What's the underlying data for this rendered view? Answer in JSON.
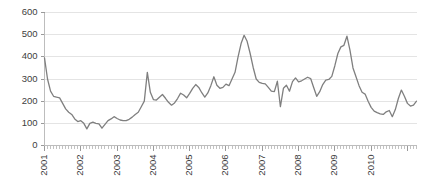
{
  "chart_data": {
    "type": "line",
    "title": "",
    "subtitle": "",
    "xlabel": "",
    "ylabel": "",
    "ylim": [
      0,
      600
    ],
    "ytick_labels": [
      "0",
      "100",
      "200",
      "300",
      "400",
      "500",
      "600"
    ],
    "yticks": [
      0,
      100,
      200,
      300,
      400,
      500,
      600
    ],
    "grid": true,
    "legend": false,
    "legend_position": "none",
    "x_tick_interval": "monthly",
    "xtick_labels": [
      "2001",
      "2002",
      "2003",
      "2004",
      "2005",
      "2006",
      "2007",
      "2008",
      "2009",
      "2010"
    ],
    "x_label_years": [
      2001,
      2002,
      2003,
      2004,
      2005,
      2006,
      2007,
      2008,
      2009,
      2010
    ],
    "x_label_rotation": -90,
    "x_start": "2001-01",
    "x_end": "2011-04",
    "series": [
      {
        "name": "series-1",
        "color": "#7f7f7f",
        "x": [
          "2001-01",
          "2001-02",
          "2001-03",
          "2001-04",
          "2001-05",
          "2001-06",
          "2001-07",
          "2001-08",
          "2001-09",
          "2001-10",
          "2001-11",
          "2001-12",
          "2002-01",
          "2002-02",
          "2002-03",
          "2002-04",
          "2002-05",
          "2002-06",
          "2002-07",
          "2002-08",
          "2002-09",
          "2002-10",
          "2002-11",
          "2002-12",
          "2003-01",
          "2003-02",
          "2003-03",
          "2003-04",
          "2003-05",
          "2003-06",
          "2003-07",
          "2003-08",
          "2003-09",
          "2003-10",
          "2003-11",
          "2003-12",
          "2004-01",
          "2004-02",
          "2004-03",
          "2004-04",
          "2004-05",
          "2004-06",
          "2004-07",
          "2004-08",
          "2004-09",
          "2004-10",
          "2004-11",
          "2004-12",
          "2005-01",
          "2005-02",
          "2005-03",
          "2005-04",
          "2005-05",
          "2005-06",
          "2005-07",
          "2005-08",
          "2005-09",
          "2005-10",
          "2005-11",
          "2005-12",
          "2006-01",
          "2006-02",
          "2006-03",
          "2006-04",
          "2006-05",
          "2006-06",
          "2006-07",
          "2006-08",
          "2006-09",
          "2006-10",
          "2006-11",
          "2006-12",
          "2007-01",
          "2007-02",
          "2007-03",
          "2007-04",
          "2007-05",
          "2007-06",
          "2007-07",
          "2007-08",
          "2007-09",
          "2007-10",
          "2007-11",
          "2007-12",
          "2008-01",
          "2008-02",
          "2008-03",
          "2008-04",
          "2008-05",
          "2008-06",
          "2008-07",
          "2008-08",
          "2008-09",
          "2008-10",
          "2008-11",
          "2008-12",
          "2009-01",
          "2009-02",
          "2009-03",
          "2009-04",
          "2009-05",
          "2009-06",
          "2009-07",
          "2009-08",
          "2009-09",
          "2009-10",
          "2009-11",
          "2009-12",
          "2010-01",
          "2010-02",
          "2010-03",
          "2010-04",
          "2010-05",
          "2010-06",
          "2010-07",
          "2010-08",
          "2010-09",
          "2010-10",
          "2010-11",
          "2010-12",
          "2011-01",
          "2011-02",
          "2011-03",
          "2011-04"
        ],
        "values": [
          395,
          300,
          245,
          222,
          218,
          215,
          190,
          165,
          150,
          140,
          120,
          108,
          112,
          100,
          75,
          100,
          105,
          100,
          98,
          78,
          95,
          112,
          120,
          130,
          122,
          115,
          112,
          112,
          118,
          128,
          140,
          150,
          175,
          200,
          330,
          240,
          207,
          205,
          218,
          230,
          213,
          195,
          182,
          192,
          212,
          236,
          228,
          215,
          235,
          258,
          275,
          262,
          238,
          218,
          237,
          270,
          310,
          272,
          258,
          262,
          277,
          270,
          300,
          330,
          400,
          460,
          497,
          470,
          415,
          352,
          300,
          285,
          280,
          278,
          262,
          245,
          243,
          290,
          175,
          258,
          272,
          245,
          288,
          305,
          287,
          292,
          300,
          308,
          302,
          262,
          222,
          243,
          275,
          295,
          298,
          312,
          360,
          415,
          445,
          452,
          493,
          430,
          350,
          310,
          270,
          240,
          232,
          200,
          172,
          155,
          148,
          143,
          140,
          152,
          158,
          130,
          162,
          212,
          250,
          222,
          190,
          178,
          182,
          200
        ],
        "key_points": [
          {
            "label": "start",
            "x": "2001-01",
            "y": 395
          },
          {
            "label": "trough",
            "x": "2002-03",
            "y": 75
          },
          {
            "label": "spike-2003",
            "x": "2003-11",
            "y": 330
          },
          {
            "label": "peak-2005",
            "x": "2006-07",
            "y": 497
          },
          {
            "label": "dip-2007",
            "x": "2007-07",
            "y": 175
          },
          {
            "label": "peak-2008",
            "x": "2009-05",
            "y": 493
          },
          {
            "label": "low-2009",
            "x": "2010-08",
            "y": 130
          },
          {
            "label": "end",
            "x": "2011-04",
            "y": 200
          }
        ]
      }
    ]
  },
  "colors": {
    "series_line": "#7f7f7f",
    "gridline": "#e4e4e4",
    "axis": "#bdbdbd",
    "tick_label": "#404040",
    "background": "#ffffff"
  }
}
